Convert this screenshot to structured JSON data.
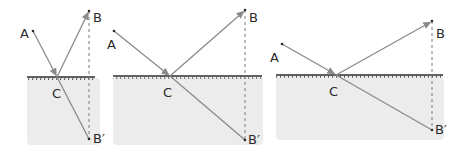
{
  "colors": {
    "ray": "#8a8a8a",
    "surface": "#2f2f2f",
    "shade": "#ececec",
    "dashed": "#7a7a7a",
    "label": "#2a2a2a"
  },
  "panels": [
    {
      "id": "panel-1",
      "labels": {
        "A": "A",
        "B": "B",
        "C": "C",
        "Bprime": "B′"
      },
      "points": {
        "A": [
          33,
          31
        ],
        "C": [
          57,
          77
        ],
        "B": [
          89,
          11
        ],
        "Bprime": [
          89,
          139
        ]
      },
      "surface": {
        "x1": 27,
        "x2": 95,
        "y": 77
      },
      "shade": {
        "x": 27,
        "y": 78,
        "w": 73,
        "h": 67
      }
    },
    {
      "id": "panel-2",
      "labels": {
        "A": "A",
        "B": "B",
        "C": "C",
        "Bprime": "B′"
      },
      "points": {
        "A": [
          114,
          31
        ],
        "C": [
          170,
          76
        ],
        "B": [
          245,
          10
        ],
        "Bprime": [
          245,
          140
        ]
      },
      "surface": {
        "x1": 113,
        "x2": 262,
        "y": 76
      },
      "shade": {
        "x": 113,
        "y": 77,
        "w": 150,
        "h": 68
      }
    },
    {
      "id": "panel-3",
      "labels": {
        "A": "A",
        "B": "B",
        "C": "C",
        "Bprime": "B′"
      },
      "points": {
        "A": [
          282,
          44
        ],
        "C": [
          336,
          75
        ],
        "B": [
          432,
          21
        ],
        "Bprime": [
          432,
          130
        ]
      },
      "surface": {
        "x1": 276,
        "x2": 443,
        "y": 75
      },
      "shade": {
        "x": 276,
        "y": 76,
        "w": 168,
        "h": 64
      }
    }
  ]
}
